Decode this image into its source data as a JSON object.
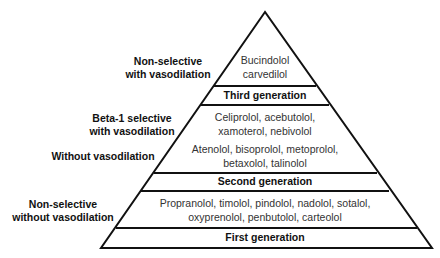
{
  "pyramid": {
    "tiers": [
      {
        "generation": "Third generation",
        "groups": [
          {
            "label_lines": [
              "Non-selective",
              "with vasodilation"
            ],
            "drugs_lines": [
              "Bucindolol",
              "carvedilol"
            ]
          }
        ]
      },
      {
        "generation": "Second generation",
        "groups": [
          {
            "label_lines": [
              "Beta-1 selective",
              "with vasodilation"
            ],
            "drugs_lines": [
              "Celiprolol, acebutolol,",
              "xamoterol, nebivolol"
            ]
          },
          {
            "label_lines": [
              "Without vasodilation"
            ],
            "drugs_lines": [
              "Atenolol, bisoprolol, metoprolol,",
              "betaxolol, talinolol"
            ]
          }
        ]
      },
      {
        "generation": "First generation",
        "groups": [
          {
            "label_lines": [
              "Non-selective",
              "without vasodilation"
            ],
            "drugs_lines": [
              "Propranolol, timolol, pindolol, nadolol, sotalol,",
              "oxyprenolol, penbutolol, carteolol"
            ]
          }
        ]
      }
    ],
    "colors": {
      "stroke": "#111111",
      "fill": "#ffffff",
      "label_text": "#111111",
      "drug_text": "#333333"
    }
  }
}
